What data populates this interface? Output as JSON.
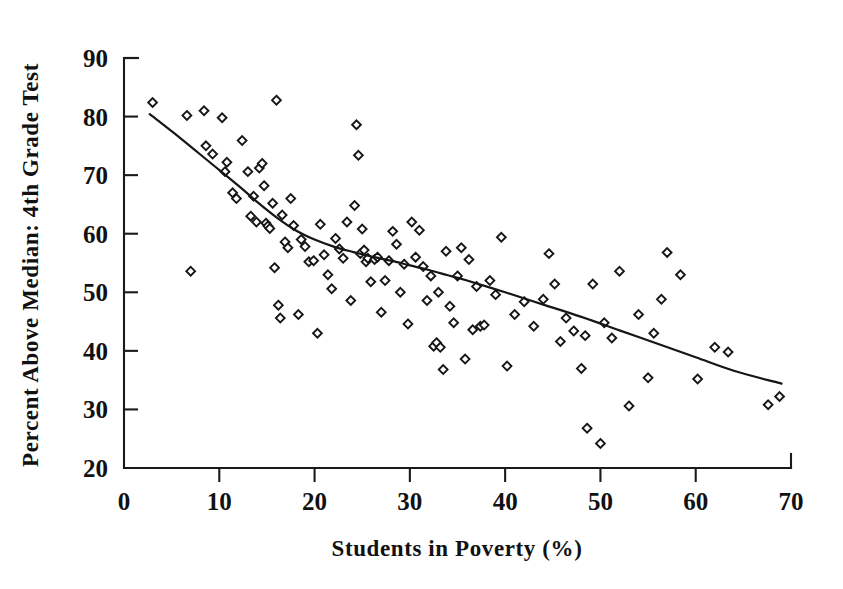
{
  "chart_data": {
    "type": "scatter",
    "title": "",
    "xlabel": "Students in Poverty (%)",
    "ylabel": "Percent Above Median: 4th Grade Test",
    "xlim": [
      0,
      70
    ],
    "ylim": [
      20,
      90
    ],
    "xticks": [
      0,
      10,
      20,
      30,
      40,
      50,
      60,
      70
    ],
    "yticks": [
      20,
      30,
      40,
      50,
      60,
      70,
      80,
      90
    ],
    "xtick_labels": [
      "0",
      "10",
      "20",
      "30",
      "40",
      "50",
      "60",
      "70"
    ],
    "ytick_labels": [
      "20",
      "30",
      "40",
      "50",
      "60",
      "70",
      "80",
      "90"
    ],
    "grid": false,
    "legend": false,
    "marker_shape": "diamond-open",
    "marker_color": "#161616",
    "series": [
      {
        "name": "Districts",
        "points": [
          [
            3.0,
            82.4
          ],
          [
            6.6,
            80.2
          ],
          [
            7.0,
            53.6
          ],
          [
            8.4,
            81.0
          ],
          [
            8.6,
            75.0
          ],
          [
            9.3,
            73.6
          ],
          [
            10.3,
            79.8
          ],
          [
            10.6,
            70.6
          ],
          [
            10.8,
            72.2
          ],
          [
            11.4,
            67.0
          ],
          [
            11.8,
            66.0
          ],
          [
            12.4,
            75.9
          ],
          [
            13.0,
            70.6
          ],
          [
            13.3,
            63.0
          ],
          [
            13.6,
            66.4
          ],
          [
            13.9,
            62.0
          ],
          [
            14.2,
            71.2
          ],
          [
            14.5,
            72.0
          ],
          [
            14.7,
            68.2
          ],
          [
            14.9,
            61.8
          ],
          [
            15.1,
            61.3
          ],
          [
            15.3,
            60.9
          ],
          [
            15.6,
            65.2
          ],
          [
            15.8,
            54.2
          ],
          [
            16.0,
            82.8
          ],
          [
            16.2,
            47.8
          ],
          [
            16.4,
            45.6
          ],
          [
            16.6,
            63.2
          ],
          [
            16.9,
            58.6
          ],
          [
            17.2,
            57.6
          ],
          [
            17.5,
            66.0
          ],
          [
            17.8,
            61.4
          ],
          [
            18.3,
            46.2
          ],
          [
            18.6,
            59.0
          ],
          [
            19.0,
            57.8
          ],
          [
            19.4,
            55.2
          ],
          [
            19.9,
            55.4
          ],
          [
            20.3,
            43.0
          ],
          [
            20.6,
            61.6
          ],
          [
            21.0,
            56.4
          ],
          [
            21.4,
            53.0
          ],
          [
            21.8,
            50.6
          ],
          [
            22.2,
            59.2
          ],
          [
            22.6,
            57.4
          ],
          [
            23.0,
            55.8
          ],
          [
            23.4,
            62.0
          ],
          [
            23.8,
            48.6
          ],
          [
            24.2,
            64.8
          ],
          [
            24.4,
            78.6
          ],
          [
            24.6,
            73.4
          ],
          [
            24.8,
            56.6
          ],
          [
            25.0,
            60.8
          ],
          [
            25.2,
            57.2
          ],
          [
            25.4,
            55.2
          ],
          [
            25.6,
            55.8
          ],
          [
            25.9,
            51.8
          ],
          [
            26.3,
            55.6
          ],
          [
            26.6,
            56.0
          ],
          [
            27.0,
            46.6
          ],
          [
            27.4,
            52.0
          ],
          [
            27.8,
            55.4
          ],
          [
            28.2,
            60.4
          ],
          [
            28.6,
            58.2
          ],
          [
            29.0,
            50.0
          ],
          [
            29.4,
            54.8
          ],
          [
            29.8,
            44.6
          ],
          [
            30.2,
            62.0
          ],
          [
            30.6,
            56.0
          ],
          [
            31.0,
            60.6
          ],
          [
            31.4,
            54.4
          ],
          [
            31.8,
            48.6
          ],
          [
            32.2,
            52.8
          ],
          [
            32.5,
            40.8
          ],
          [
            32.8,
            41.4
          ],
          [
            33.0,
            50.0
          ],
          [
            33.2,
            40.6
          ],
          [
            33.5,
            36.8
          ],
          [
            33.8,
            57.0
          ],
          [
            34.2,
            47.6
          ],
          [
            34.6,
            44.8
          ],
          [
            35.0,
            52.8
          ],
          [
            35.4,
            57.6
          ],
          [
            35.8,
            38.6
          ],
          [
            36.2,
            55.6
          ],
          [
            36.6,
            43.6
          ],
          [
            37.0,
            51.0
          ],
          [
            37.4,
            44.2
          ],
          [
            37.8,
            44.4
          ],
          [
            38.4,
            52.0
          ],
          [
            39.0,
            49.6
          ],
          [
            39.6,
            59.4
          ],
          [
            40.2,
            37.4
          ],
          [
            41.0,
            46.2
          ],
          [
            42.0,
            48.4
          ],
          [
            43.0,
            44.2
          ],
          [
            44.0,
            48.8
          ],
          [
            44.6,
            56.6
          ],
          [
            45.2,
            51.4
          ],
          [
            45.8,
            41.6
          ],
          [
            46.4,
            45.6
          ],
          [
            47.2,
            43.4
          ],
          [
            48.0,
            37.0
          ],
          [
            48.4,
            42.6
          ],
          [
            48.6,
            26.8
          ],
          [
            49.2,
            51.4
          ],
          [
            50.0,
            24.2
          ],
          [
            50.4,
            44.8
          ],
          [
            51.2,
            42.2
          ],
          [
            52.0,
            53.6
          ],
          [
            53.0,
            30.6
          ],
          [
            54.0,
            46.2
          ],
          [
            55.0,
            35.4
          ],
          [
            55.6,
            43.0
          ],
          [
            56.4,
            48.8
          ],
          [
            57.0,
            56.8
          ],
          [
            58.4,
            53.0
          ],
          [
            60.2,
            35.2
          ],
          [
            62.0,
            40.6
          ],
          [
            63.4,
            39.8
          ],
          [
            67.6,
            30.8
          ],
          [
            68.8,
            32.2
          ]
        ]
      }
    ],
    "trend_line": {
      "name": "Fitted curve",
      "points": [
        [
          2.7,
          80.4
        ],
        [
          6.0,
          76.2
        ],
        [
          9.0,
          72.2
        ],
        [
          12.0,
          68.2
        ],
        [
          14.0,
          65.4
        ],
        [
          16.0,
          62.8
        ],
        [
          18.0,
          60.6
        ],
        [
          20.0,
          59.0
        ],
        [
          22.0,
          57.8
        ],
        [
          24.0,
          56.9
        ],
        [
          26.0,
          56.1
        ],
        [
          28.0,
          55.4
        ],
        [
          30.0,
          54.6
        ],
        [
          32.0,
          53.8
        ],
        [
          34.0,
          52.9
        ],
        [
          36.0,
          52.0
        ],
        [
          40.0,
          50.0
        ],
        [
          44.0,
          47.9
        ],
        [
          48.0,
          45.8
        ],
        [
          52.0,
          43.5
        ],
        [
          56.0,
          41.2
        ],
        [
          60.0,
          38.9
        ],
        [
          64.0,
          36.6
        ],
        [
          69.0,
          34.4
        ]
      ]
    }
  },
  "axis": {
    "x_title": "Students in Poverty (%)",
    "y_title": "Percent Above Median: 4th Grade Test"
  }
}
